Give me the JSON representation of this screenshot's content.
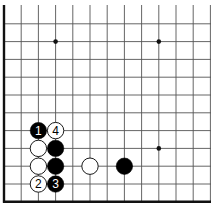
{
  "diagram": {
    "type": "go-board-corner",
    "corner": "bottom-left",
    "colors": {
      "background": "#ffffff",
      "grid": "#555555",
      "edge": "#111111",
      "black_stone": "#000000",
      "white_stone": "#ffffff",
      "stone_outline": "#000000"
    },
    "star_points": [
      {
        "col": 3,
        "row": 2
      },
      {
        "col": 9,
        "row": 2
      },
      {
        "col": 9,
        "row": 8
      }
    ],
    "stones": [
      {
        "color": "black",
        "col": 2,
        "row": 7,
        "label": "1"
      },
      {
        "color": "white",
        "col": 3,
        "row": 7,
        "label": "4"
      },
      {
        "color": "white",
        "col": 2,
        "row": 8,
        "label": ""
      },
      {
        "color": "black",
        "col": 3,
        "row": 8,
        "label": ""
      },
      {
        "color": "white",
        "col": 2,
        "row": 9,
        "label": ""
      },
      {
        "color": "black",
        "col": 3,
        "row": 9,
        "label": ""
      },
      {
        "color": "white",
        "col": 2,
        "row": 10,
        "label": "2"
      },
      {
        "color": "black",
        "col": 3,
        "row": 10,
        "label": "3"
      },
      {
        "color": "white",
        "col": 5,
        "row": 9,
        "label": ""
      },
      {
        "color": "black",
        "col": 7,
        "row": 9,
        "label": ""
      }
    ]
  }
}
